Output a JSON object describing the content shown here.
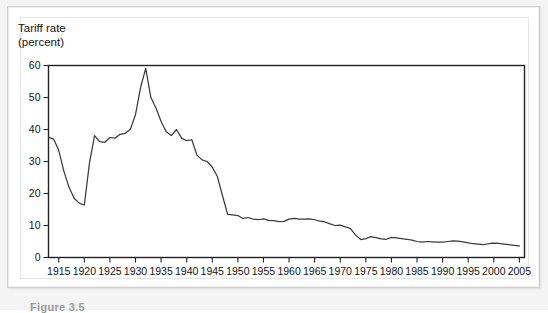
{
  "figure": {
    "caption": "Figure 3.5",
    "axis_title_line1": "Tariff rate",
    "axis_title_line2": "(percent)"
  },
  "chart_data": {
    "type": "line",
    "title": "Tariff rate (percent)",
    "xlabel": "",
    "ylabel": "Tariff rate (percent)",
    "xlim": [
      1913,
      2006
    ],
    "ylim": [
      0,
      60
    ],
    "yticks": [
      0,
      10,
      20,
      30,
      40,
      50,
      60
    ],
    "xticks": [
      1915,
      1920,
      1925,
      1930,
      1935,
      1940,
      1945,
      1950,
      1955,
      1960,
      1965,
      1970,
      1975,
      1980,
      1985,
      1990,
      1995,
      2000,
      2005
    ],
    "grid": false,
    "legend": null,
    "line_color": "#3a3a3a",
    "series": [
      {
        "name": "Tariff rate",
        "x": [
          1913,
          1914,
          1915,
          1916,
          1917,
          1918,
          1919,
          1920,
          1921,
          1922,
          1923,
          1924,
          1925,
          1926,
          1927,
          1928,
          1929,
          1930,
          1931,
          1932,
          1933,
          1934,
          1935,
          1936,
          1937,
          1938,
          1939,
          1940,
          1941,
          1942,
          1943,
          1944,
          1945,
          1946,
          1947,
          1948,
          1949,
          1950,
          1951,
          1952,
          1953,
          1954,
          1955,
          1956,
          1957,
          1958,
          1959,
          1960,
          1961,
          1962,
          1963,
          1964,
          1965,
          1966,
          1967,
          1968,
          1969,
          1970,
          1971,
          1972,
          1973,
          1974,
          1975,
          1976,
          1977,
          1978,
          1979,
          1980,
          1981,
          1982,
          1983,
          1984,
          1985,
          1986,
          1987,
          1988,
          1989,
          1990,
          1991,
          1992,
          1993,
          1994,
          1995,
          1996,
          1997,
          1998,
          1999,
          2000,
          2001,
          2002,
          2003,
          2004,
          2005
        ],
        "values": [
          37.6,
          37.0,
          33.5,
          27.0,
          22.0,
          18.5,
          17.0,
          16.4,
          29.5,
          38.1,
          36.2,
          36.0,
          37.5,
          37.3,
          38.5,
          38.8,
          40.1,
          44.7,
          53.2,
          59.1,
          50.0,
          46.7,
          42.5,
          39.3,
          38.1,
          40.0,
          37.3,
          36.5,
          36.8,
          32.0,
          30.5,
          30.0,
          28.2,
          25.3,
          19.3,
          13.5,
          13.3,
          13.1,
          12.2,
          12.5,
          12.0,
          11.8,
          12.1,
          11.6,
          11.5,
          11.2,
          11.3,
          12.0,
          12.2,
          12.0,
          12.0,
          12.1,
          11.8,
          11.4,
          11.1,
          10.5,
          10.0,
          10.1,
          9.6,
          9.0,
          7.0,
          5.6,
          5.9,
          6.5,
          6.2,
          5.8,
          5.7,
          6.3,
          6.1,
          5.9,
          5.7,
          5.4,
          5.0,
          4.8,
          5.0,
          4.9,
          4.8,
          4.8,
          5.0,
          5.2,
          5.1,
          4.9,
          4.6,
          4.3,
          4.2,
          4.0,
          4.3,
          4.5,
          4.4,
          4.2,
          4.0,
          3.8,
          3.6
        ]
      }
    ]
  }
}
